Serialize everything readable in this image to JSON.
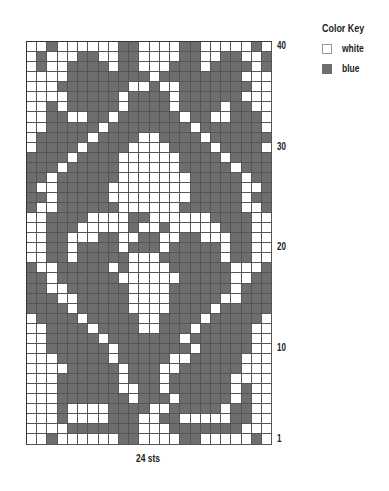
{
  "key": {
    "title": "Color Key",
    "items": [
      {
        "label": "white",
        "color": "#ffffff"
      },
      {
        "label": "blue",
        "color": "#6e6e6e"
      }
    ]
  },
  "row_labels": [
    {
      "label": "40",
      "row": 40
    },
    {
      "label": "30",
      "row": 30
    },
    {
      "label": "20",
      "row": 20
    },
    {
      "label": "10",
      "row": 10
    },
    {
      "label": "1",
      "row": 1
    }
  ],
  "stitch_count": "24 sts",
  "chart_data": {
    "type": "heatmap",
    "title": "Color Key",
    "columns": 24,
    "rows": 40,
    "xlabel": "24 sts",
    "ylabel": "rows",
    "legend": {
      "0": "white",
      "1": "blue"
    },
    "grid_top_to_bottom": [
      "001000000110000110000010",
      "010001100110000110011001",
      "010011110110001110111101",
      "000011111111011111111000",
      "000111111100100111111100",
      "000011111011110111111000",
      "001011111011110111101100",
      "001100110111111011001110",
      "001111101111111101111110",
      "011111011110011110111111",
      "011110111100001111011110",
      "111101111000000111101111",
      "111011111000000111110111",
      "110111111000000011111011",
      "100111110000000011111001",
      "110111110000000011111011",
      "100111111000000111111001",
      "001111000011000000111100",
      "001110000010010000011100",
      "001100011001100110001100",
      "001101111011101111101100",
      "001101111100011111101100",
      "100111110100001111110001",
      "110111111000000111110011",
      "110011111100001111110111",
      "111001111100001111100111",
      "111101111100001111011111",
      "011110111110011110111110",
      "001111011110011101111100",
      "001111101111111011111100",
      "001111110111111101111100",
      "000111110111110011111000",
      "000011111011100111111000",
      "000111111011101111110000",
      "000111111001101111110100",
      "000111111101110111110100",
      "000100001111001111101100",
      "000100001110011000001100",
      "000011111110001111111000",
      "001000000110000110000010"
    ]
  }
}
